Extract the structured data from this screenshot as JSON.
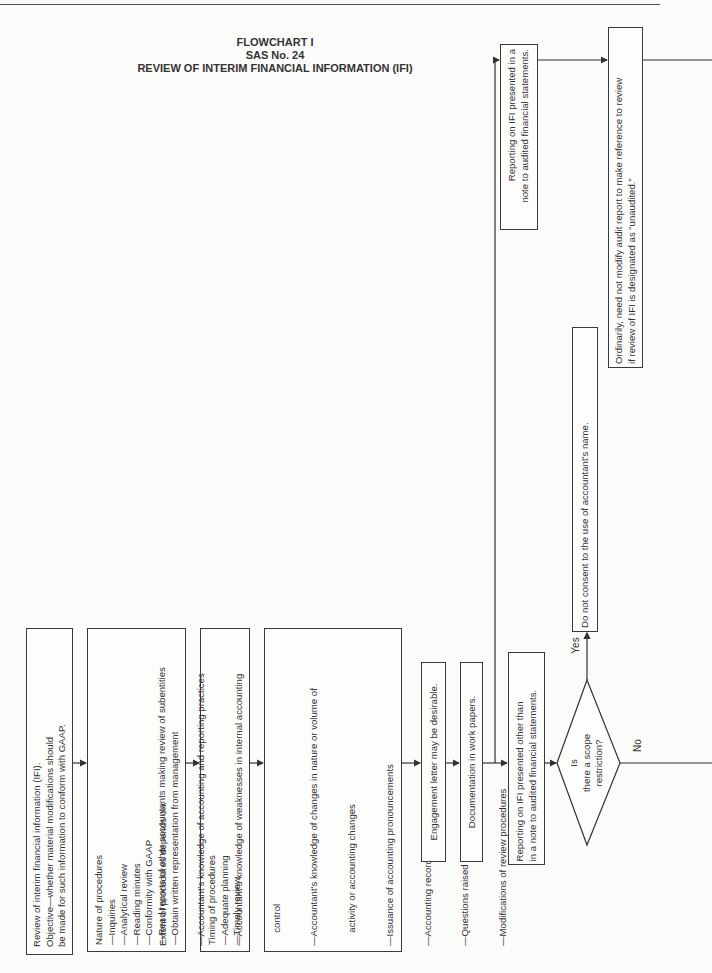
{
  "title": {
    "line1": "FLOWCHART I",
    "line2": "SAS No. 24",
    "line3": "REVIEW OF INTERIM FINANCIAL INFORMATION (IFI)"
  },
  "boxes": {
    "review": {
      "lines": [
        "Review of interim financial information (IFI).",
        "Objective—whether material modifications should",
        "be made for such information to conform with GAAP."
      ]
    },
    "nature": {
      "lines": [
        "Nature of procedures",
        "—Inquiries",
        "—Analytical review",
        "—Reading minutes",
        "—Conformity with GAAP",
        "—Read reports of other accountants making review of subentities",
        "—Obtain written representation from management"
      ]
    },
    "timing": {
      "lines": [
        "Timing of procedures",
        "—Adequate planning",
        "—Timely review"
      ]
    },
    "extent": {
      "lines": [
        "Extent of procedures depends on:",
        "—Accountant's knowledge of accounting and reporting practices",
        "—Accountant's knowledge of weaknesses in internal accounting",
        "     control",
        "—Accountant's knowledge of changes in nature or volume of",
        "     activity or accounting changes",
        "—Issuance of accounting pronouncements",
        "—Accounting records maintained at multiple locations",
        "—Questions raised in performing other procedures",
        "—Modifications of review procedures"
      ]
    },
    "engagement": {
      "lines": [
        "Engagement letter may be desirable."
      ]
    },
    "documentation": {
      "lines": [
        "Documentation in work papers."
      ]
    },
    "reporting_other": {
      "lines": [
        "Reporting on IFI presented other than",
        "in a note to audited financial statements."
      ]
    },
    "reporting_note": {
      "lines": [
        "Reporting on IFI presented in a",
        "note to audited financial statements."
      ]
    },
    "do_not_consent": {
      "lines": [
        "Do not consent to the use of accountant's name."
      ]
    },
    "ordinarily": {
      "lines": [
        "Ordinarily, need not modify audit report to make reference to review",
        "if review of IFI is designated as “unaudited.”"
      ]
    }
  },
  "decision": {
    "lines": [
      "Is",
      "there a scope",
      "restriction?"
    ],
    "yes_label": "Yes",
    "no_label": "No"
  }
}
